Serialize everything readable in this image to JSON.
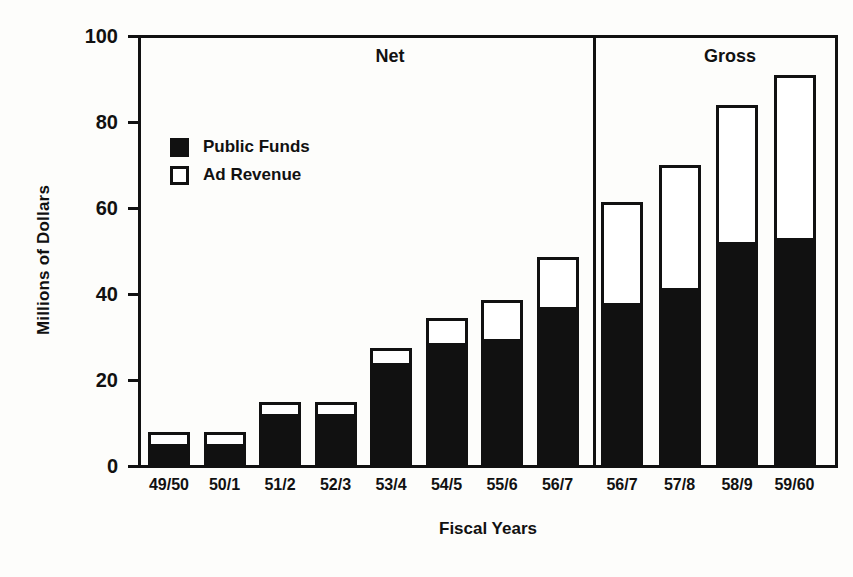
{
  "chart_data": {
    "type": "bar",
    "title": "",
    "xlabel": "Fiscal Years",
    "ylabel": "Millions of Dollars",
    "ylim": [
      0,
      100
    ],
    "yticks": [
      0,
      20,
      40,
      60,
      80,
      100
    ],
    "ytick_labels": [
      "0",
      "20",
      "40",
      "60",
      "80",
      "100"
    ],
    "grid": false,
    "stacked": true,
    "legend_position": "upper-left-inside",
    "categories": [
      "49/50",
      "50/1",
      "51/2",
      "52/3",
      "53/4",
      "54/5",
      "55/6",
      "56/7",
      "56/7",
      "57/8",
      "58/9",
      "59/60"
    ],
    "series": [
      {
        "name": "Public Funds",
        "color": "#111111",
        "values": [
          5.0,
          5.0,
          12.0,
          12.0,
          24.0,
          28.5,
          29.5,
          37.0,
          37.8,
          41.5,
          52.0,
          53.0
        ]
      },
      {
        "name": "Ad Revenue",
        "color": "#ffffff",
        "values": [
          3.0,
          3.0,
          2.8,
          2.9,
          3.5,
          6.0,
          9.0,
          11.5,
          23.7,
          28.5,
          32.0,
          38.0
        ]
      }
    ],
    "totals": [
      8.0,
      8.0,
      14.8,
      14.9,
      27.5,
      34.5,
      38.5,
      48.5,
      61.5,
      70.0,
      84.0,
      91.0
    ],
    "sections": [
      {
        "label": "Net",
        "start_index": 0,
        "end_index": 7
      },
      {
        "label": "Gross",
        "start_index": 8,
        "end_index": 11
      }
    ],
    "annotations": [
      "Net",
      "Gross"
    ]
  },
  "legend": {
    "items": [
      {
        "label": "Public Funds",
        "swatch": "filled"
      },
      {
        "label": "Ad Revenue",
        "swatch": "hollow"
      }
    ]
  },
  "axes": {
    "y_title": "Millions of Dollars",
    "x_title": "Fiscal Years"
  },
  "colors": {
    "public_funds": "#111111",
    "ad_revenue": "#ffffff",
    "axis": "#111111",
    "background": "#fdfdfb"
  }
}
